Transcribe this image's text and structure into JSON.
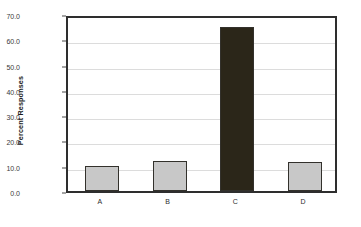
{
  "chart_data": {
    "type": "bar",
    "title": "",
    "xlabel": "",
    "ylabel": "Percent Responses",
    "categories": [
      "A",
      "B",
      "C",
      "D"
    ],
    "values": [
      10.0,
      12.0,
      65.0,
      11.5
    ],
    "ylim": [
      0.0,
      70.0
    ],
    "ytick_step": 10.0,
    "ytick_labels": [
      "0.0",
      "10.0",
      "20.0",
      "30.0",
      "40.0",
      "50.0",
      "60.0",
      "70.0"
    ],
    "ytick_values": [
      0,
      10,
      20,
      30,
      40,
      50,
      60,
      70
    ],
    "grid": "horizontal",
    "legend": "none",
    "bar_colors": [
      "#c8c8c8",
      "#c8c8c8",
      "#2b2619",
      "#c8c8c8"
    ],
    "bar_border_color": "#33312c",
    "frame_color": "#2e2e2e",
    "gridline_color": "#dcdcdc",
    "background_color": "#ffffff"
  }
}
